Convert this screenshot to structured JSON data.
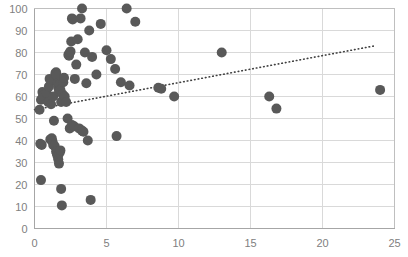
{
  "chart_data": {
    "type": "scatter",
    "title": "",
    "xlabel": "",
    "ylabel": "",
    "xlim": [
      0,
      25
    ],
    "ylim": [
      0,
      100
    ],
    "xticks": [
      0,
      5,
      10,
      15,
      20,
      25
    ],
    "yticks": [
      0,
      10,
      20,
      30,
      40,
      50,
      60,
      70,
      80,
      90,
      100
    ],
    "xtick_labels": [
      "0",
      "5",
      "10",
      "15",
      "20",
      "25"
    ],
    "ytick_labels": [
      "0",
      "10",
      "20",
      "30",
      "40",
      "50",
      "60",
      "70",
      "80",
      "90",
      "100"
    ],
    "grid": "horizontal-and-vertical",
    "legend": "none",
    "marker_color": "#595959",
    "marker_size": 5,
    "gridline_color": "#d9d9d9",
    "axis_color": "#a6a6a6",
    "tick_label_color": "#808080",
    "series": [
      {
        "name": "observations",
        "marker": "circle",
        "points": [
          [
            0.35,
            54.0
          ],
          [
            0.45,
            58.5
          ],
          [
            0.55,
            62.0
          ],
          [
            0.6,
            60.5
          ],
          [
            0.85,
            61.5
          ],
          [
            0.95,
            57.5
          ],
          [
            1.0,
            64.5
          ],
          [
            1.05,
            68.0
          ],
          [
            1.15,
            56.5
          ],
          [
            1.3,
            60.0
          ],
          [
            1.35,
            67.5
          ],
          [
            1.45,
            70.5
          ],
          [
            1.5,
            71.0
          ],
          [
            1.55,
            69.5
          ],
          [
            1.6,
            66.0
          ],
          [
            1.65,
            64.0
          ],
          [
            1.7,
            62.5
          ],
          [
            1.75,
            65.5
          ],
          [
            1.8,
            63.0
          ],
          [
            1.85,
            57.5
          ],
          [
            1.95,
            61.0
          ],
          [
            2.0,
            66.5
          ],
          [
            2.05,
            68.5
          ],
          [
            2.1,
            60.0
          ],
          [
            2.2,
            57.5
          ],
          [
            2.35,
            79.0
          ],
          [
            2.4,
            78.5
          ],
          [
            2.45,
            80.0
          ],
          [
            2.5,
            80.5
          ],
          [
            2.55,
            85.0
          ],
          [
            2.6,
            95.5
          ],
          [
            2.65,
            95.0
          ],
          [
            2.8,
            68.0
          ],
          [
            2.9,
            74.5
          ],
          [
            3.0,
            86.0
          ],
          [
            3.2,
            95.5
          ],
          [
            3.3,
            100.0
          ],
          [
            3.5,
            80.0
          ],
          [
            3.6,
            66.0
          ],
          [
            3.8,
            90.0
          ],
          [
            4.0,
            78.0
          ],
          [
            4.3,
            70.0
          ],
          [
            4.6,
            93.0
          ],
          [
            5.0,
            81.0
          ],
          [
            5.3,
            77.0
          ],
          [
            5.6,
            72.5
          ],
          [
            6.0,
            66.5
          ],
          [
            6.4,
            100.0
          ],
          [
            6.6,
            65.0
          ],
          [
            7.0,
            94.0
          ],
          [
            8.6,
            64.0
          ],
          [
            8.8,
            63.5
          ],
          [
            9.7,
            60.0
          ],
          [
            13.0,
            80.0
          ],
          [
            16.3,
            60.0
          ],
          [
            16.8,
            54.5
          ],
          [
            24.0,
            63.0
          ],
          [
            0.4,
            38.5
          ],
          [
            0.5,
            38.0
          ],
          [
            0.45,
            22.0
          ],
          [
            1.1,
            40.5
          ],
          [
            1.2,
            41.0
          ],
          [
            1.25,
            39.5
          ],
          [
            1.3,
            38.0
          ],
          [
            1.35,
            49.0
          ],
          [
            1.4,
            37.5
          ],
          [
            1.5,
            35.0
          ],
          [
            1.55,
            34.0
          ],
          [
            1.6,
            33.0
          ],
          [
            1.65,
            31.5
          ],
          [
            1.7,
            29.5
          ],
          [
            1.75,
            34.5
          ],
          [
            1.8,
            35.5
          ],
          [
            1.85,
            18.0
          ],
          [
            1.9,
            10.5
          ],
          [
            2.3,
            50.0
          ],
          [
            2.45,
            45.5
          ],
          [
            2.6,
            47.0
          ],
          [
            2.75,
            46.5
          ],
          [
            3.1,
            45.5
          ],
          [
            3.3,
            44.5
          ],
          [
            3.4,
            44.0
          ],
          [
            3.7,
            40.0
          ],
          [
            3.9,
            13.0
          ],
          [
            5.7,
            42.0
          ]
        ]
      }
    ],
    "trendline": {
      "type": "linear-dotted",
      "color": "#404040",
      "x_start": 0.0,
      "y_start": 54.0,
      "x_end": 23.6,
      "y_end": 83.0
    }
  }
}
